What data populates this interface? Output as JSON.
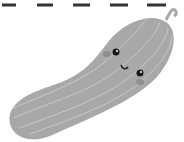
{
  "image": {
    "subject": "cucumber-cartoon",
    "dash_count": 5,
    "colors": {
      "body": "#a8a8a8",
      "stripe": "#c4c4c4",
      "dash": "#333333",
      "eye": "#1a1a1a",
      "cheek": "#8e8e8e"
    }
  }
}
